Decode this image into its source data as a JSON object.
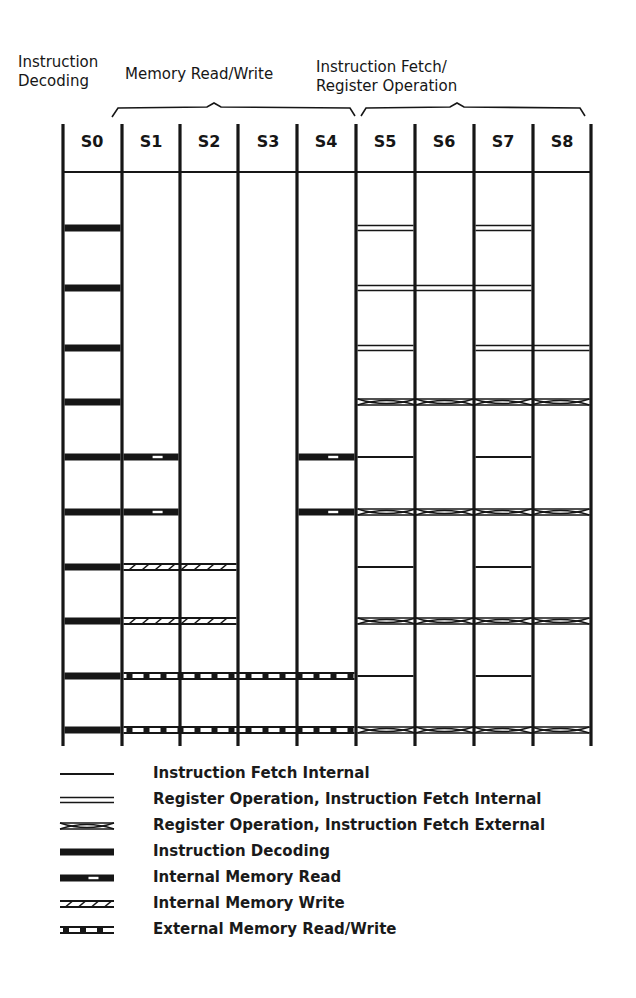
{
  "headers": {
    "instruction_decoding": "Instruction\nDecoding",
    "memory_rw": "Memory Read/Write",
    "fetch_register": "Instruction Fetch/\nRegister Operation"
  },
  "columns": [
    "S0",
    "S1",
    "S2",
    "S3",
    "S4",
    "S5",
    "S6",
    "S7",
    "S8"
  ],
  "colors": {
    "ink": "#161616",
    "background": "#ffffff"
  },
  "grid": {
    "column_x": [
      63,
      122,
      180,
      238,
      297,
      356,
      415,
      474,
      533,
      591
    ],
    "header_separator_y": 172,
    "top_y": 124,
    "bottom_y": 746,
    "rows": [
      {
        "y": 228,
        "segments": [
          {
            "type": "instruction_decoding",
            "from": 0,
            "to": 1
          },
          {
            "type": "register_op_fetch_internal",
            "from": 5,
            "to": 6
          },
          {
            "type": "register_op_fetch_internal",
            "from": 7,
            "to": 8
          }
        ]
      },
      {
        "y": 288,
        "segments": [
          {
            "type": "instruction_decoding",
            "from": 0,
            "to": 1
          },
          {
            "type": "register_op_fetch_internal",
            "from": 5,
            "to": 8
          }
        ]
      },
      {
        "y": 348,
        "segments": [
          {
            "type": "instruction_decoding",
            "from": 0,
            "to": 1
          },
          {
            "type": "register_op_fetch_internal",
            "from": 5,
            "to": 6
          },
          {
            "type": "register_op_fetch_internal",
            "from": 7,
            "to": 9
          }
        ]
      },
      {
        "y": 402,
        "segments": [
          {
            "type": "instruction_decoding",
            "from": 0,
            "to": 1
          },
          {
            "type": "register_op_fetch_external",
            "from": 5,
            "to": 9
          }
        ]
      },
      {
        "y": 457,
        "segments": [
          {
            "type": "instruction_decoding",
            "from": 0,
            "to": 1
          },
          {
            "type": "internal_memory_read",
            "from": 1,
            "to": 2
          },
          {
            "type": "internal_memory_read",
            "from": 4,
            "to": 5
          },
          {
            "type": "instruction_fetch_internal",
            "from": 5,
            "to": 6
          },
          {
            "type": "instruction_fetch_internal",
            "from": 7,
            "to": 8
          }
        ]
      },
      {
        "y": 512,
        "segments": [
          {
            "type": "instruction_decoding",
            "from": 0,
            "to": 1
          },
          {
            "type": "internal_memory_read",
            "from": 1,
            "to": 2
          },
          {
            "type": "internal_memory_read",
            "from": 4,
            "to": 5
          },
          {
            "type": "register_op_fetch_external",
            "from": 5,
            "to": 9
          }
        ]
      },
      {
        "y": 567,
        "segments": [
          {
            "type": "instruction_decoding",
            "from": 0,
            "to": 1
          },
          {
            "type": "internal_memory_write",
            "from": 1,
            "to": 3
          },
          {
            "type": "instruction_fetch_internal",
            "from": 5,
            "to": 6
          },
          {
            "type": "instruction_fetch_internal",
            "from": 7,
            "to": 8
          }
        ]
      },
      {
        "y": 621,
        "segments": [
          {
            "type": "instruction_decoding",
            "from": 0,
            "to": 1
          },
          {
            "type": "internal_memory_write",
            "from": 1,
            "to": 3
          },
          {
            "type": "register_op_fetch_external",
            "from": 5,
            "to": 9
          }
        ]
      },
      {
        "y": 676,
        "segments": [
          {
            "type": "instruction_decoding",
            "from": 0,
            "to": 1
          },
          {
            "type": "external_memory_rw",
            "from": 1,
            "to": 5
          },
          {
            "type": "instruction_fetch_internal",
            "from": 5,
            "to": 6
          },
          {
            "type": "instruction_fetch_internal",
            "from": 7,
            "to": 8
          }
        ]
      },
      {
        "y": 730,
        "segments": [
          {
            "type": "instruction_decoding",
            "from": 0,
            "to": 1
          },
          {
            "type": "external_memory_rw",
            "from": 1,
            "to": 5
          },
          {
            "type": "register_op_fetch_external",
            "from": 5,
            "to": 9
          }
        ]
      }
    ]
  },
  "legend": [
    {
      "type": "instruction_fetch_internal",
      "label": "Instruction Fetch Internal"
    },
    {
      "type": "register_op_fetch_internal",
      "label": "Register Operation, Instruction Fetch Internal"
    },
    {
      "type": "register_op_fetch_external",
      "label": "Register Operation, Instruction Fetch External"
    },
    {
      "type": "instruction_decoding",
      "label": "Instruction Decoding"
    },
    {
      "type": "internal_memory_read",
      "label": "Internal Memory Read"
    },
    {
      "type": "internal_memory_write",
      "label": "Internal Memory Write"
    },
    {
      "type": "external_memory_rw",
      "label": "External Memory Read/Write"
    }
  ]
}
